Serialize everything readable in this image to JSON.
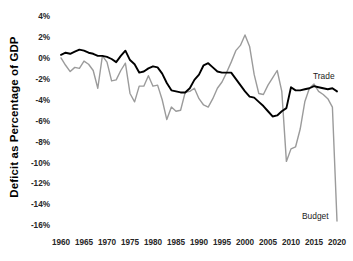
{
  "chart_data": {
    "type": "line",
    "title": "",
    "xlabel": "",
    "ylabel": "Deficit as Percentage of GDP",
    "xlim": [
      1960,
      2020
    ],
    "ylim": [
      -16,
      4
    ],
    "grid": false,
    "legend_position": "inline-end-of-line",
    "y_tick_labels": [
      "4%",
      "2%",
      "0%",
      "-2%",
      "-4%",
      "-6%",
      "-8%",
      "-10%",
      "-12%",
      "-14%",
      "-16%"
    ],
    "y_tick_values": [
      4,
      2,
      0,
      -2,
      -4,
      -6,
      -8,
      -10,
      -12,
      -14,
      -16
    ],
    "x_tick_labels": [
      "1960",
      "1965",
      "1970",
      "1975",
      "1980",
      "1985",
      "1990",
      "1995",
      "2000",
      "2005",
      "2010",
      "2015",
      "2020"
    ],
    "x_tick_values": [
      1960,
      1965,
      1970,
      1975,
      1980,
      1985,
      1990,
      1995,
      2000,
      2005,
      2010,
      2015,
      2020
    ],
    "x": [
      1960,
      1961,
      1962,
      1963,
      1964,
      1965,
      1966,
      1967,
      1968,
      1969,
      1970,
      1971,
      1972,
      1973,
      1974,
      1975,
      1976,
      1977,
      1978,
      1979,
      1980,
      1981,
      1982,
      1983,
      1984,
      1985,
      1986,
      1987,
      1988,
      1989,
      1990,
      1991,
      1992,
      1993,
      1994,
      1995,
      1996,
      1997,
      1998,
      1999,
      2000,
      2001,
      2002,
      2003,
      2004,
      2005,
      2006,
      2007,
      2008,
      2009,
      2010,
      2011,
      2012,
      2013,
      2014,
      2015,
      2016,
      2017,
      2018,
      2019,
      2020
    ],
    "series": [
      {
        "name": "Trade",
        "label": "Trade",
        "color": "#000000",
        "values": [
          0.4,
          0.6,
          0.5,
          0.7,
          0.9,
          0.8,
          0.6,
          0.5,
          0.3,
          0.3,
          0.2,
          0.0,
          -0.3,
          0.3,
          0.8,
          -0.1,
          -0.5,
          -1.3,
          -1.2,
          -0.9,
          -0.7,
          -0.8,
          -1.4,
          -2.3,
          -3.0,
          -3.1,
          -3.2,
          -3.2,
          -2.8,
          -2.0,
          -1.5,
          -0.6,
          -0.4,
          -0.8,
          -1.2,
          -1.3,
          -1.3,
          -1.3,
          -1.9,
          -2.5,
          -3.1,
          -3.6,
          -3.7,
          -4.1,
          -4.5,
          -5.0,
          -5.5,
          -5.4,
          -5.0,
          -4.7,
          -2.7,
          -3.0,
          -3.0,
          -2.9,
          -2.8,
          -2.6,
          -2.7,
          -2.8,
          -2.9,
          -2.8,
          -3.1
        ]
      },
      {
        "name": "Budget",
        "label": "Budget",
        "color": "#9b9b9b",
        "values": [
          0.1,
          -0.6,
          -1.2,
          -0.8,
          -0.9,
          -0.2,
          -0.5,
          -1.1,
          -2.8,
          0.3,
          -0.3,
          -2.1,
          -2.0,
          -1.1,
          -0.4,
          -3.3,
          -4.1,
          -2.6,
          -2.6,
          -1.6,
          -2.6,
          -2.5,
          -3.9,
          -5.8,
          -4.6,
          -5.0,
          -4.9,
          -3.2,
          -3.1,
          -2.8,
          -3.8,
          -4.4,
          -4.6,
          -3.8,
          -2.8,
          -2.2,
          -1.3,
          -0.3,
          0.8,
          1.3,
          2.3,
          1.2,
          -1.5,
          -3.3,
          -3.4,
          -2.5,
          -1.8,
          -1.1,
          -3.1,
          -9.8,
          -8.6,
          -8.4,
          -6.7,
          -4.1,
          -2.8,
          -2.4,
          -3.1,
          -3.4,
          -3.8,
          -4.6,
          -15.5
        ]
      }
    ]
  }
}
